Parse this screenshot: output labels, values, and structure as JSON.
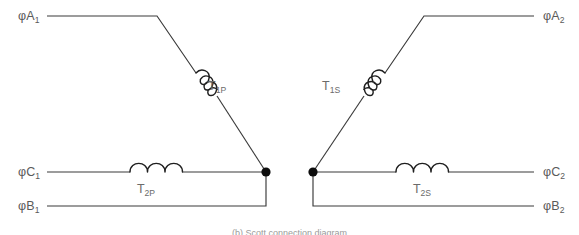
{
  "diagram": {
    "type": "electrical-schematic",
    "title_caption": "(b) Scott connection diagram",
    "background_color": "#ffffff",
    "wire_color": "#3a3a3a",
    "coil_color": "#1f1f1f",
    "label_color": "#5a5a5a",
    "junction_color": "#0d0d0d",
    "primary_side": {
      "name": "primary",
      "terminals": [
        {
          "id": "A1",
          "phi": "φ",
          "letter": "A",
          "sub": "1",
          "label": "φA₁",
          "x": 18,
          "y": 20,
          "side": "left"
        },
        {
          "id": "C1",
          "phi": "φ",
          "letter": "C",
          "sub": "1",
          "label": "φC₁",
          "x": 18,
          "y": 176,
          "side": "left"
        },
        {
          "id": "B1",
          "phi": "φ",
          "letter": "B",
          "sub": "1",
          "label": "φB₁",
          "x": 18,
          "y": 210,
          "side": "left"
        }
      ],
      "coils": [
        {
          "id": "T1P",
          "letter": "T",
          "sub": "1P",
          "label": "T₁ₚ",
          "orientation": "diagonal",
          "turns": 3,
          "label_x": 208,
          "label_y": 90
        },
        {
          "id": "T2P",
          "letter": "T",
          "sub": "2P",
          "label": "T₂ₚ",
          "orientation": "horizontal",
          "turns": 3,
          "label_x": 160,
          "label_y": 193
        }
      ],
      "junction": {
        "x": 266,
        "y": 172,
        "radius": 4.6
      }
    },
    "secondary_side": {
      "name": "secondary",
      "terminals": [
        {
          "id": "A2",
          "phi": "φ",
          "letter": "A",
          "sub": "2",
          "label": "φA₂",
          "x": 543,
          "y": 20,
          "side": "right"
        },
        {
          "id": "C2",
          "phi": "φ",
          "letter": "C",
          "sub": "2",
          "label": "φC₂",
          "x": 543,
          "y": 176,
          "side": "right"
        },
        {
          "id": "B2",
          "phi": "φ",
          "letter": "B",
          "sub": "2",
          "label": "φB₂",
          "x": 543,
          "y": 210,
          "side": "right"
        }
      ],
      "coils": [
        {
          "id": "T1S",
          "letter": "T",
          "sub": "1S",
          "label": "T₁ₛ",
          "orientation": "diagonal",
          "turns": 3,
          "label_x": 330,
          "label_y": 90
        },
        {
          "id": "T2S",
          "letter": "T",
          "sub": "2S",
          "label": "T₂ₛ",
          "orientation": "horizontal",
          "turns": 3,
          "label_x": 420,
          "label_y": 193
        }
      ],
      "junction": {
        "x": 313,
        "y": 172,
        "radius": 4.6
      }
    }
  }
}
